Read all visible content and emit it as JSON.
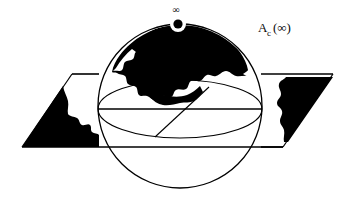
{
  "figure": {
    "type": "mathematical-diagram",
    "background_color": "#ffffff",
    "ink_color": "#000000",
    "labels": {
      "basin_label_main": "A",
      "basin_label_subscript": "c",
      "basin_label_argument": "(∞)",
      "point_at_infinity": "∞"
    },
    "elements": {
      "sphere_name": "riemann-sphere",
      "plane_name": "complex-plane",
      "black_region_name": "attracting-basin",
      "pole_marker_name": "point-at-infinity-marker",
      "equator_name": "equator-ellipse",
      "diameter_name": "horizontal-diameter",
      "diagonal_name": "diagonal-chord"
    },
    "geometry": {
      "sphere_center_x": 180,
      "sphere_center_y": 106,
      "sphere_radius": 82,
      "equator_rx": 82,
      "equator_ry": 29,
      "equator_cy": 109,
      "plane_top_y": 74,
      "plane_bottom_y": 147,
      "plane_left_x": 22,
      "plane_right_x": 333,
      "infinity_marker_x": 178,
      "infinity_marker_y": 24,
      "infinity_marker_outer_r": 8,
      "infinity_marker_inner_r": 4.6,
      "infinity_text_x": 176,
      "infinity_text_y": 13,
      "basin_label_x": 272,
      "basin_label_y": 31
    }
  }
}
